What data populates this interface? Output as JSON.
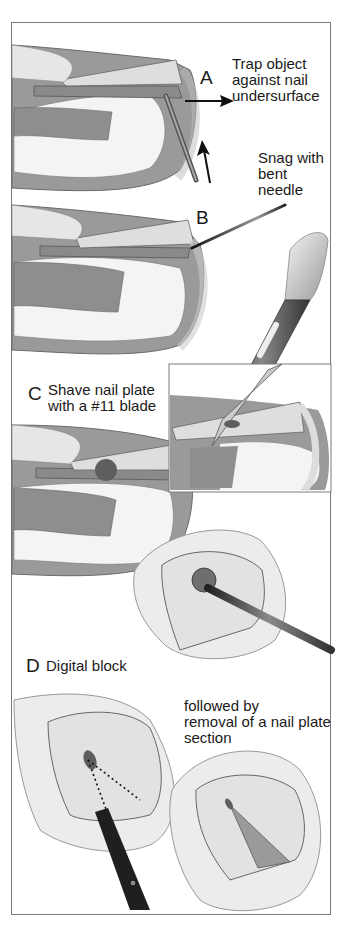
{
  "figure": {
    "panels": [
      {
        "id": "A",
        "letter": "A",
        "caption": [
          "Trap object",
          "against nail",
          "undersurface"
        ],
        "secondary_caption": [
          "Snag with",
          "bent",
          "needle"
        ]
      },
      {
        "id": "B",
        "letter": "B"
      },
      {
        "id": "C",
        "letter": "C",
        "caption": [
          "Shave nail plate",
          "with a #11 blade"
        ]
      },
      {
        "id": "D",
        "letter": "D",
        "caption": [
          "Digital block"
        ],
        "secondary_caption": [
          "followed by",
          "removal of a nail plate",
          "section"
        ]
      }
    ],
    "colors": {
      "frame": "#7a7a7a",
      "soft_tissue": "#9a9a9a",
      "bone": "#f4f4f4",
      "nail": "#dedede",
      "skin": "#e8e8e8",
      "instrument_dark": "#2a2a2a",
      "foreign_body": "#5e5e5e"
    }
  }
}
